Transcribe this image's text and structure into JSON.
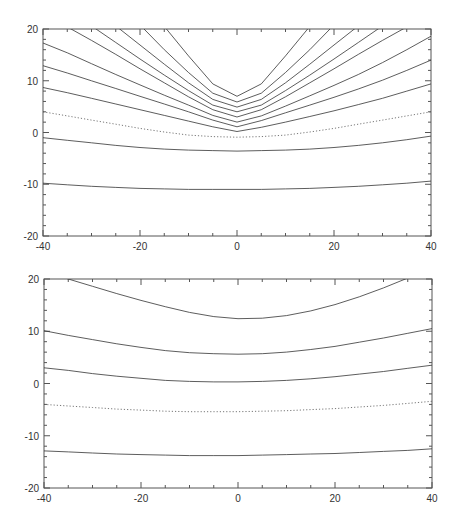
{
  "chart_data": [
    {
      "type": "line",
      "title": "",
      "xlabel": "",
      "ylabel": "",
      "xlim": [
        -40,
        40
      ],
      "ylim": [
        -20,
        20
      ],
      "grid": false,
      "legend": null,
      "x_ticks": [
        -40,
        -20,
        0,
        20,
        40
      ],
      "y_ticks": [
        -20,
        -10,
        0,
        10,
        20
      ],
      "x_tick_labels": [
        "-40",
        "-20",
        "0",
        "20",
        "40"
      ],
      "y_tick_labels": [
        "-20",
        "-10",
        "0",
        "10",
        "20"
      ],
      "frame_px": {
        "left": 43,
        "top": 29,
        "right": 431,
        "bottom": 236
      },
      "x": [
        -40,
        -35,
        -30,
        -25,
        -20,
        -15,
        -10,
        -5,
        0,
        5,
        10,
        15,
        20,
        25,
        30,
        35,
        40
      ],
      "series": [
        {
          "name": "contour-1",
          "style": "solid",
          "values": [
            null,
            null,
            null,
            null,
            null,
            20.5,
            14.8,
            9.4,
            7.0,
            9.4,
            14.8,
            20.5,
            null,
            null,
            null,
            null,
            null
          ]
        },
        {
          "name": "contour-2",
          "style": "solid",
          "values": [
            null,
            null,
            null,
            null,
            20.8,
            16.0,
            11.6,
            7.6,
            5.9,
            7.6,
            11.6,
            16.0,
            20.8,
            null,
            null,
            null,
            null
          ]
        },
        {
          "name": "contour-3",
          "style": "solid",
          "values": [
            null,
            null,
            null,
            20.6,
            16.9,
            13.2,
            9.6,
            6.4,
            4.9,
            6.4,
            9.6,
            13.2,
            16.9,
            20.6,
            null,
            null,
            null
          ]
        },
        {
          "name": "contour-4",
          "style": "solid",
          "values": [
            null,
            null,
            20.6,
            17.4,
            14.2,
            11.1,
            8.1,
            5.3,
            4.0,
            5.3,
            8.1,
            11.1,
            14.2,
            17.4,
            20.6,
            null,
            null
          ]
        },
        {
          "name": "contour-5",
          "style": "solid",
          "values": [
            null,
            20.4,
            17.8,
            15.1,
            12.3,
            9.6,
            6.9,
            4.4,
            3.0,
            4.4,
            6.9,
            9.6,
            12.3,
            15.1,
            17.8,
            20.4,
            null
          ]
        },
        {
          "name": "contour-6",
          "style": "solid",
          "values": [
            17.3,
            15.4,
            13.3,
            11.2,
            9.2,
            7.2,
            5.3,
            3.3,
            2.0,
            3.2,
            5.1,
            7.1,
            9.1,
            11.2,
            13.5,
            16.0,
            18.6
          ]
        },
        {
          "name": "contour-7",
          "style": "solid",
          "values": [
            12.9,
            11.5,
            10.0,
            8.5,
            7.0,
            5.5,
            4.0,
            2.4,
            1.1,
            2.3,
            3.8,
            5.3,
            6.8,
            8.4,
            10.1,
            12.0,
            14.0
          ]
        },
        {
          "name": "contour-8",
          "style": "solid",
          "values": [
            8.7,
            7.7,
            6.6,
            5.5,
            4.4,
            3.3,
            2.2,
            1.1,
            0.2,
            1.0,
            2.0,
            3.1,
            4.2,
            5.4,
            6.6,
            8.0,
            9.4
          ]
        },
        {
          "name": "contour-9",
          "style": "dotted",
          "values": [
            4.0,
            3.2,
            2.4,
            1.6,
            0.8,
            0.1,
            -0.5,
            -0.8,
            -0.9,
            -0.8,
            -0.5,
            0.1,
            0.8,
            1.6,
            2.4,
            3.2,
            4.0
          ]
        },
        {
          "name": "contour-10",
          "style": "solid",
          "values": [
            -1.0,
            -1.5,
            -2.0,
            -2.5,
            -2.9,
            -3.2,
            -3.4,
            -3.5,
            -3.6,
            -3.5,
            -3.4,
            -3.2,
            -2.9,
            -2.5,
            -2.0,
            -1.4,
            -0.7
          ]
        },
        {
          "name": "contour-11",
          "style": "solid",
          "values": [
            -9.8,
            -10.1,
            -10.4,
            -10.6,
            -10.8,
            -10.9,
            -11.0,
            -11.0,
            -11.0,
            -11.0,
            -10.9,
            -10.8,
            -10.6,
            -10.4,
            -10.1,
            -9.8,
            -9.4
          ]
        }
      ]
    },
    {
      "type": "line",
      "title": "",
      "xlabel": "",
      "ylabel": "",
      "xlim": [
        -40,
        40
      ],
      "ylim": [
        -20,
        20
      ],
      "grid": false,
      "legend": null,
      "x_ticks": [
        -40,
        -20,
        0,
        20,
        40
      ],
      "y_ticks": [
        -20,
        -10,
        0,
        10,
        20
      ],
      "x_tick_labels": [
        "-40",
        "-20",
        "0",
        "20",
        "40"
      ],
      "y_tick_labels": [
        "-20",
        "-10",
        "0",
        "10",
        "20"
      ],
      "frame_px": {
        "left": 44,
        "top": 279,
        "right": 432,
        "bottom": 488
      },
      "x": [
        -40,
        -35,
        -30,
        -25,
        -20,
        -15,
        -10,
        -5,
        0,
        5,
        10,
        15,
        20,
        25,
        30,
        35,
        40
      ],
      "series": [
        {
          "name": "contour-1",
          "style": "solid",
          "values": [
            null,
            20.0,
            18.6,
            17.2,
            15.9,
            14.7,
            13.6,
            12.8,
            12.4,
            12.5,
            13.0,
            13.9,
            15.1,
            16.6,
            18.3,
            20.2,
            null
          ]
        },
        {
          "name": "contour-2",
          "style": "solid",
          "values": [
            10.1,
            9.2,
            8.4,
            7.6,
            6.9,
            6.3,
            5.9,
            5.7,
            5.6,
            5.7,
            6.0,
            6.5,
            7.1,
            7.9,
            8.7,
            9.6,
            10.5
          ]
        },
        {
          "name": "contour-3",
          "style": "solid",
          "values": [
            3.0,
            2.5,
            1.9,
            1.4,
            1.0,
            0.6,
            0.4,
            0.3,
            0.3,
            0.4,
            0.6,
            0.9,
            1.3,
            1.8,
            2.3,
            2.9,
            3.5
          ]
        },
        {
          "name": "contour-4",
          "style": "dotted",
          "values": [
            -4.0,
            -4.3,
            -4.6,
            -4.9,
            -5.1,
            -5.3,
            -5.4,
            -5.4,
            -5.4,
            -5.3,
            -5.2,
            -5.0,
            -4.8,
            -4.5,
            -4.2,
            -3.8,
            -3.4
          ]
        },
        {
          "name": "contour-5",
          "style": "solid",
          "values": [
            -12.9,
            -13.1,
            -13.3,
            -13.5,
            -13.6,
            -13.7,
            -13.8,
            -13.8,
            -13.8,
            -13.7,
            -13.6,
            -13.5,
            -13.4,
            -13.2,
            -13.0,
            -12.8,
            -12.5
          ]
        }
      ]
    }
  ]
}
